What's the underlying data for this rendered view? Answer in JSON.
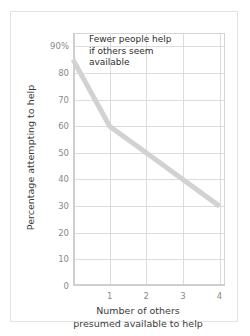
{
  "chart_data": {
    "type": "line",
    "title": "",
    "xlabel": "Number of others presumed available to help",
    "xlabel_lines": [
      "Number of others",
      "presumed available to help"
    ],
    "ylabel": "Percentage attempting to help",
    "x": [
      0,
      1,
      2,
      3,
      4
    ],
    "values": [
      85,
      60,
      50,
      40,
      30
    ],
    "series": [
      {
        "name": "Percentage attempting to help",
        "values": [
          85,
          60,
          50,
          40,
          30
        ],
        "color": "#d2d2d2"
      }
    ],
    "xlim": [
      0,
      4.15
    ],
    "ylim": [
      0,
      95
    ],
    "xticks": [
      1,
      2,
      3,
      4
    ],
    "xtick_labels": [
      "1",
      "2",
      "3",
      "4"
    ],
    "yticks": [
      0,
      10,
      20,
      30,
      40,
      50,
      60,
      70,
      80,
      90
    ],
    "ytick_labels": [
      "0",
      "10",
      "20",
      "30",
      "40",
      "50",
      "60",
      "70",
      "80",
      "90%"
    ],
    "grid": true,
    "legend": "none",
    "annotations": [
      {
        "name": "callout",
        "lines": [
          "Fewer people help",
          "if others seem",
          "available"
        ],
        "text": "Fewer people help if others seem available"
      }
    ],
    "colors": {
      "line": "#d2d2d2",
      "gridline": "#dcdcdc",
      "axis": "#cfcfcf",
      "tick_label": "#8a8a8a",
      "axis_title": "#3b3b3b",
      "annotation_text": "#2e2e2e",
      "card_border": "#e2e2e2",
      "background": "#ffffff"
    }
  }
}
